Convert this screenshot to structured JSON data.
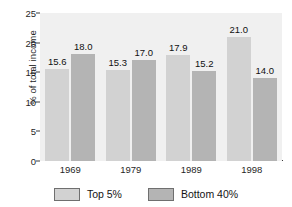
{
  "chart_data": {
    "type": "bar",
    "title": "",
    "xlabel": "",
    "ylabel": "% of total income",
    "categories": [
      "1969",
      "1979",
      "1989",
      "1998"
    ],
    "series": [
      {
        "name": "Top 5%",
        "color": "#d2d2d2",
        "values": [
          15.6,
          15.3,
          17.9,
          21.0
        ],
        "labels": [
          "15.6",
          "15.3",
          "17.9",
          "21.0"
        ]
      },
      {
        "name": "Bottom 40%",
        "color": "#b4b4b4",
        "values": [
          18.0,
          17.0,
          15.2,
          14.0
        ],
        "labels": [
          "18.0",
          "17.0",
          "15.2",
          "14.0"
        ]
      }
    ],
    "ylim": [
      0,
      25
    ],
    "yticks": [
      0,
      5,
      10,
      15,
      20,
      25
    ],
    "ytick_labels": [
      "0",
      "5",
      "10",
      "15",
      "20",
      "25"
    ],
    "grid": false,
    "legend_position": "bottom",
    "plot_background": "#f0f0f0",
    "figure_background": "#ffffff",
    "axis_color": "#3a3a3a"
  },
  "legend": {
    "items": [
      {
        "label": "Top 5%"
      },
      {
        "label": "Bottom 40%"
      }
    ]
  }
}
